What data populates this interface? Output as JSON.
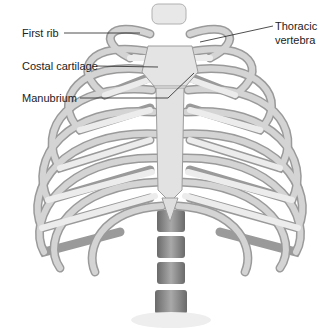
{
  "diagram": {
    "labels": [
      {
        "id": "first-rib",
        "text": "First rib",
        "x": 22,
        "y": 27
      },
      {
        "id": "costal-cartilage",
        "text": "Costal cartilage",
        "x": 22,
        "y": 60
      },
      {
        "id": "manubrium",
        "text": "Manubrium",
        "x": 22,
        "y": 92
      },
      {
        "id": "thoracic-vertebra-1",
        "text": "Thoracic",
        "x": 275,
        "y": 20
      },
      {
        "id": "thoracic-vertebra-2",
        "text": "vertebra",
        "x": 275,
        "y": 34
      }
    ],
    "colors": {
      "bone": "#d9d9d9",
      "bone_shadow": "#8a8a8a",
      "cartilage": "#ececec",
      "outline": "#7a7a7a",
      "leader_line": "#222222",
      "vertebra_dark": "#6e6e6e"
    }
  }
}
